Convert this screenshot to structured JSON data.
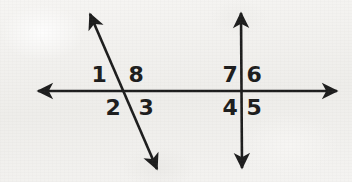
{
  "figure": {
    "background_color": "#f3f2f0",
    "ink_color": "#1d1d1d",
    "canvas": {
      "width": 352,
      "height": 182
    }
  },
  "lines": [
    {
      "name": "horizontal-line",
      "kind": "double-arrow-line",
      "x1": 38,
      "y1": 91,
      "x2": 337,
      "y2": 91,
      "stroke_width": 2.6
    },
    {
      "name": "diagonal-transversal-line",
      "kind": "double-arrow-line",
      "x1": 90,
      "y1": 14,
      "x2": 157,
      "y2": 169,
      "stroke_width": 2.6
    },
    {
      "name": "vertical-transversal-line",
      "kind": "double-arrow-line",
      "x1": 241,
      "y1": 13,
      "x2": 242,
      "y2": 168,
      "stroke_width": 2.6
    }
  ],
  "intersections": [
    {
      "name": "left-intersection",
      "x": 122,
      "y": 91
    },
    {
      "name": "right-intersection",
      "x": 241,
      "y": 91
    }
  ],
  "angle_labels": [
    {
      "id": "angle-1",
      "text": "1",
      "x": 99,
      "y": 75,
      "position": "upper-left-of-left-intersection"
    },
    {
      "id": "angle-8",
      "text": "8",
      "x": 136,
      "y": 75,
      "position": "upper-right-of-left-intersection"
    },
    {
      "id": "angle-2",
      "text": "2",
      "x": 113,
      "y": 108,
      "position": "lower-left-of-left-intersection"
    },
    {
      "id": "angle-3",
      "text": "3",
      "x": 146,
      "y": 108,
      "position": "lower-right-of-left-intersection"
    },
    {
      "id": "angle-7",
      "text": "7",
      "x": 230,
      "y": 75,
      "position": "upper-left-of-right-intersection"
    },
    {
      "id": "angle-6",
      "text": "6",
      "x": 254,
      "y": 75,
      "position": "upper-right-of-right-intersection"
    },
    {
      "id": "angle-4",
      "text": "4",
      "x": 230,
      "y": 108,
      "position": "lower-left-of-right-intersection"
    },
    {
      "id": "angle-5",
      "text": "5",
      "x": 254,
      "y": 108,
      "position": "lower-right-of-right-intersection"
    }
  ]
}
